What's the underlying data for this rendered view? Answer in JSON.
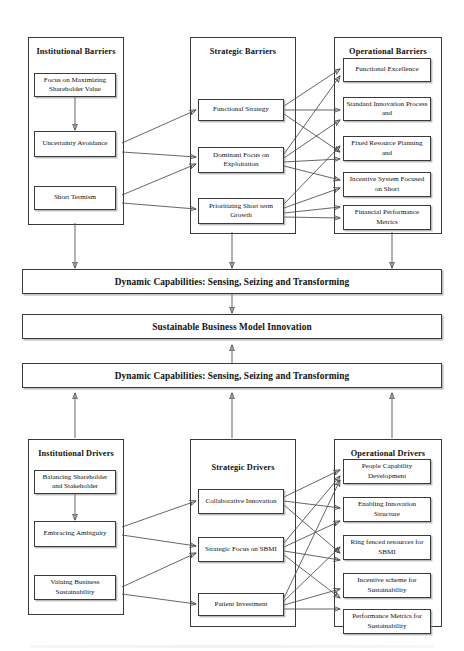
{
  "diagram": {
    "groups": {
      "institutional_barriers": {
        "title": "Institutional Barriers",
        "nodes": [
          {
            "id": "focus-maximizing-shareholder-value",
            "label": "Focus on Maximizing Shareholder Value"
          },
          {
            "id": "uncertainty-avoidance",
            "label": "Uncertainty Avoidance"
          },
          {
            "id": "short-termism",
            "label": "Short Termism"
          }
        ]
      },
      "strategic_barriers": {
        "title": "Strategic Barriers",
        "nodes": [
          {
            "id": "functional-strategy",
            "label": "Functional Strategy"
          },
          {
            "id": "dominant-focus-exploitation",
            "label": "Dominant Focus on Exploitation"
          },
          {
            "id": "prioritizing-short-term-growth",
            "label": "Prioritizing Short term Growth"
          }
        ]
      },
      "operational_barriers": {
        "title": "Operational Barriers",
        "nodes": [
          {
            "id": "functional-excellence",
            "label": "Functional Excellence"
          },
          {
            "id": "standard-innovation-process",
            "label": "Standard Innovation Process and"
          },
          {
            "id": "fixed-resource-planning",
            "label": "Fixed Resource Planning and"
          },
          {
            "id": "incentive-system-short",
            "label": "Incentive System Focused on Short"
          },
          {
            "id": "financial-performance-metrics",
            "label": "Financial Performance Metrics"
          }
        ]
      },
      "institutional_drivers": {
        "title": "Institutional Drivers",
        "nodes": [
          {
            "id": "balancing-shareholder-stakeholder",
            "label": "Balancing Shareholder and Stakeholder"
          },
          {
            "id": "embracing-ambiguity",
            "label": "Embracing Ambiguity"
          },
          {
            "id": "valuing-business-sustainability",
            "label": "Valuing Business Sustainability"
          }
        ]
      },
      "strategic_drivers": {
        "title": "Strategic Drivers",
        "nodes": [
          {
            "id": "collaborative-innovation",
            "label": "Collaborative Innovation"
          },
          {
            "id": "strategic-focus-sbmi",
            "label": "Strategic Focus on SBMI"
          },
          {
            "id": "patient-investment",
            "label": "Patient Investment"
          }
        ]
      },
      "operational_drivers": {
        "title": "Operational Drivers",
        "nodes": [
          {
            "id": "people-capability-development",
            "label": "People Capability Development"
          },
          {
            "id": "enabling-innovation-structure",
            "label": "Enabling Innovation Structure"
          },
          {
            "id": "ring-fenced-resources-sbmi",
            "label": "Ring fenced resources for SBMI"
          },
          {
            "id": "incentive-scheme-sustainability",
            "label": "Incentive scheme for Sustainability"
          },
          {
            "id": "performance-metrics-sustainability",
            "label": "Performance Metrics for Sustainability"
          }
        ]
      }
    },
    "banners": [
      {
        "id": "dynamic-capabilities-top",
        "label": "Dynamic Capabilities: Sensing, Seizing and Transforming"
      },
      {
        "id": "sustainable-business-model-innovation",
        "label": "Sustainable Business Model Innovation"
      },
      {
        "id": "dynamic-capabilities-bottom",
        "label": "Dynamic Capabilities: Sensing, Seizing and Transforming"
      }
    ],
    "colors": {
      "line": "#4a4a4a",
      "border": "#3a3a3a",
      "background": "#ffffff",
      "shadow": "#828282"
    }
  }
}
